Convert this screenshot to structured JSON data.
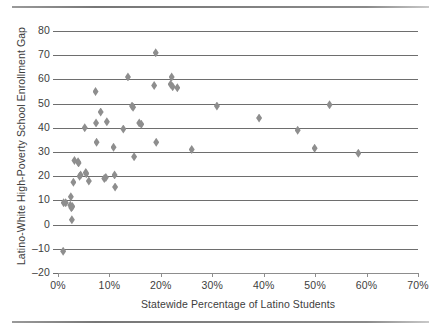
{
  "chart_data": {
    "type": "scatter",
    "title": "",
    "xlabel": "Statewide Percentage of Latino Students",
    "ylabel": "Latino-White High-Poverty School Enrollment Gap",
    "xlim": [
      0,
      70
    ],
    "ylim": [
      -20,
      80
    ],
    "xticks": [
      0,
      10,
      20,
      30,
      40,
      50,
      60,
      70
    ],
    "xtick_labels": [
      "0%",
      "10%",
      "20%",
      "30%",
      "40%",
      "50%",
      "60%",
      "70%"
    ],
    "yticks": [
      -20,
      -10,
      0,
      10,
      20,
      30,
      40,
      50,
      60,
      70,
      80
    ],
    "ytick_labels": [
      "–20",
      "–10",
      "0",
      "10",
      "20",
      "30",
      "40",
      "50",
      "60",
      "70",
      "80"
    ],
    "grid": "horizontal",
    "legend": "none",
    "marker": "diamond",
    "marker_color": "#8e8e8e",
    "points": [
      {
        "x": 1.0,
        "y": -11
      },
      {
        "x": 1.1,
        "y": 9
      },
      {
        "x": 1.5,
        "y": 9
      },
      {
        "x": 2.4,
        "y": 8
      },
      {
        "x": 2.5,
        "y": 11.5
      },
      {
        "x": 2.6,
        "y": 7
      },
      {
        "x": 2.7,
        "y": 2
      },
      {
        "x": 2.8,
        "y": 7.5
      },
      {
        "x": 3.0,
        "y": 17.5
      },
      {
        "x": 3.2,
        "y": 26.5
      },
      {
        "x": 3.9,
        "y": 26
      },
      {
        "x": 4.0,
        "y": 25.5
      },
      {
        "x": 4.2,
        "y": 20
      },
      {
        "x": 4.4,
        "y": 20.5
      },
      {
        "x": 5.2,
        "y": 40
      },
      {
        "x": 5.4,
        "y": 21.5
      },
      {
        "x": 5.5,
        "y": 21
      },
      {
        "x": 6.0,
        "y": 18
      },
      {
        "x": 7.3,
        "y": 55
      },
      {
        "x": 7.4,
        "y": 42
      },
      {
        "x": 7.5,
        "y": 34
      },
      {
        "x": 8.3,
        "y": 46.5
      },
      {
        "x": 9.0,
        "y": 19
      },
      {
        "x": 9.3,
        "y": 19.5
      },
      {
        "x": 9.5,
        "y": 42.5
      },
      {
        "x": 10.8,
        "y": 32
      },
      {
        "x": 11.0,
        "y": 20.5
      },
      {
        "x": 11.1,
        "y": 15.5
      },
      {
        "x": 12.7,
        "y": 39.5
      },
      {
        "x": 13.6,
        "y": 61
      },
      {
        "x": 14.4,
        "y": 49
      },
      {
        "x": 14.6,
        "y": 48.5
      },
      {
        "x": 14.8,
        "y": 28
      },
      {
        "x": 15.8,
        "y": 42
      },
      {
        "x": 16.2,
        "y": 41.5
      },
      {
        "x": 18.7,
        "y": 57.5
      },
      {
        "x": 19.0,
        "y": 71
      },
      {
        "x": 19.1,
        "y": 34
      },
      {
        "x": 21.9,
        "y": 58
      },
      {
        "x": 22.1,
        "y": 61
      },
      {
        "x": 22.3,
        "y": 57
      },
      {
        "x": 23.2,
        "y": 56.5
      },
      {
        "x": 26.0,
        "y": 31
      },
      {
        "x": 30.9,
        "y": 49
      },
      {
        "x": 39.1,
        "y": 44
      },
      {
        "x": 46.6,
        "y": 39
      },
      {
        "x": 49.9,
        "y": 31.5
      },
      {
        "x": 52.8,
        "y": 49.5
      },
      {
        "x": 58.4,
        "y": 29.5
      }
    ]
  }
}
